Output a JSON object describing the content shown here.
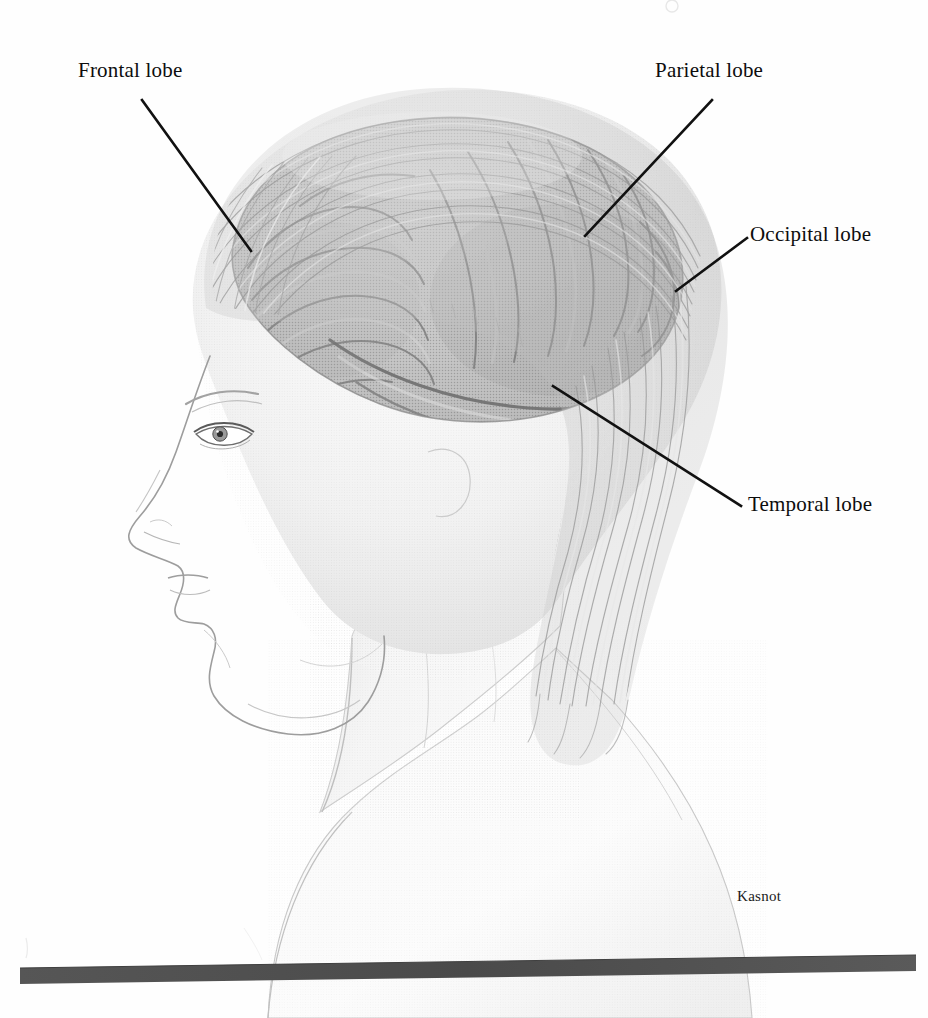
{
  "figure": {
    "kind": "anatomical-illustration",
    "medium": "grayscale airbrush / halftone rendering",
    "background_color": "#fefefe"
  },
  "labels": {
    "frontal": "Frontal lobe",
    "parietal": "Parietal lobe",
    "occipital": "Occipital lobe",
    "temporal": "Temporal lobe"
  },
  "credit": {
    "artist": "Kasnot"
  },
  "colors": {
    "ink": "#0d0d0d",
    "leader_line": "#111111",
    "brain_mid": "#a9a9a9",
    "brain_dark": "#8c8c8c",
    "brain_light": "#c9c9c9",
    "skin": "#ededed",
    "skin_shade": "#d8d8d8",
    "hair": "#b4b4b4",
    "baseline_bar": "#4f4f4f"
  },
  "baseline": {
    "present": true,
    "description": "dark gray horizontal ground bar beneath the figure"
  }
}
